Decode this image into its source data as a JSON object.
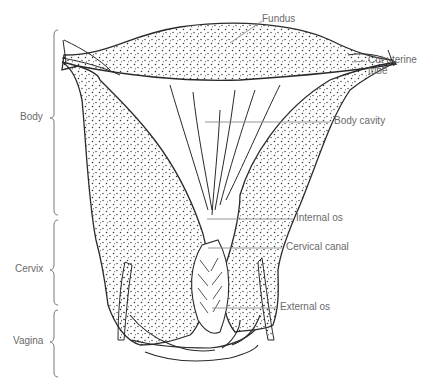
{
  "figure": {
    "right_labels": {
      "fundus": "Fundus",
      "cut_uterine_tube_line1": "Cut uterine",
      "cut_uterine_tube_line2": "tube",
      "body_cavity": "Body cavity",
      "internal_os": "Internal os",
      "cervical_canal": "Cervical canal",
      "external_os": "External os"
    },
    "left_regions": {
      "body": "Body",
      "cervix": "Cervix",
      "vagina": "Vagina"
    },
    "colors": {
      "ink": "#2a2a2a",
      "label_text": "#6a6a6a",
      "leader_line": "#8a8a8a",
      "background": "#ffffff"
    }
  }
}
